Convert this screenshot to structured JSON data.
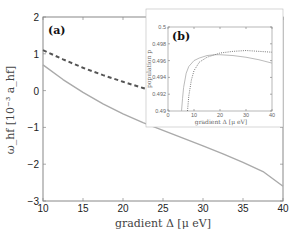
{
  "chart_data": [
    {
      "id": "main",
      "type": "line",
      "panel_label": "(a)",
      "xlabel": "gradient Δ [μ eV]",
      "ylabel": "ω_hf [10⁻³ a_hf]",
      "xlim": [
        10,
        40
      ],
      "ylim": [
        -3,
        2
      ],
      "xticks": [
        10,
        15,
        20,
        25,
        30,
        35,
        40
      ],
      "yticks": [
        -3,
        -2,
        -1,
        0,
        1,
        2
      ],
      "grid": false,
      "series": [
        {
          "name": "dashed",
          "style": "dashed",
          "color": "#555555",
          "x": [
            10,
            12.5,
            15,
            17.5,
            20,
            22.5,
            25,
            27.5,
            30,
            32.5,
            35,
            37.5,
            40
          ],
          "y": [
            1.1,
            0.85,
            0.62,
            0.42,
            0.24,
            0.07,
            -0.09,
            -0.24,
            -0.38,
            -0.52,
            -0.66,
            -0.8,
            -0.95
          ]
        },
        {
          "name": "solid",
          "style": "solid",
          "color": "#aaaaaa",
          "x": [
            10,
            12.5,
            15,
            17.5,
            20,
            22.5,
            25,
            27.5,
            30,
            32.5,
            35,
            37.5,
            40
          ],
          "y": [
            0.7,
            0.3,
            -0.05,
            -0.36,
            -0.63,
            -0.87,
            -1.08,
            -1.29,
            -1.5,
            -1.72,
            -1.95,
            -2.2,
            -2.6
          ]
        }
      ]
    },
    {
      "id": "inset",
      "type": "line",
      "panel_label": "(b)",
      "xlabel": "gradient Δ [μ eV]",
      "ylabel": "population p",
      "xlim": [
        0,
        40
      ],
      "ylim": [
        0.49,
        0.5
      ],
      "xticks": [
        0,
        10,
        20,
        30,
        40
      ],
      "yticks": [
        0.49,
        0.492,
        0.494,
        0.496,
        0.498,
        0.5
      ],
      "ytick_labels": [
        "0.49",
        "0.492",
        "0.494",
        "0.496",
        "0.498",
        "0.5"
      ],
      "grid": false,
      "series": [
        {
          "name": "solid",
          "style": "solid",
          "color": "#aaaaaa",
          "x": [
            5.2,
            5.6,
            6,
            7,
            8,
            10,
            12,
            15,
            18,
            20,
            25,
            30,
            35,
            40
          ],
          "y": [
            0.49,
            0.4915,
            0.4928,
            0.4945,
            0.4953,
            0.496,
            0.4963,
            0.4966,
            0.4967,
            0.4967,
            0.4966,
            0.4964,
            0.4961,
            0.4957
          ]
        },
        {
          "name": "dotted",
          "style": "dotted",
          "color": "#555555",
          "x": [
            7.5,
            8,
            9,
            10,
            12,
            15,
            18,
            20,
            25,
            30,
            35,
            40
          ],
          "y": [
            0.49,
            0.4918,
            0.4937,
            0.4948,
            0.4958,
            0.4964,
            0.4967,
            0.4969,
            0.4971,
            0.4972,
            0.4971,
            0.497
          ]
        }
      ]
    }
  ]
}
